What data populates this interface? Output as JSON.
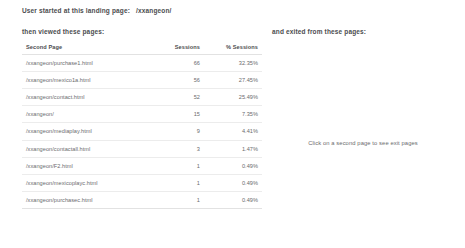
{
  "header": {
    "landing_label": "User started at this landing page:",
    "landing_page": "/xxangeon/",
    "left_caption": "then viewed these pages:",
    "right_caption": "and exited from these pages:"
  },
  "table": {
    "columns": {
      "page": "Second Page",
      "sessions": "Sessions",
      "pct_sessions": "% Sessions"
    },
    "rows": [
      {
        "page": "/xxangeon/purchase1.html",
        "sessions": "66",
        "pct": "32.35%"
      },
      {
        "page": "/xxangeon/mexico1a.html",
        "sessions": "56",
        "pct": "27.45%"
      },
      {
        "page": "/xxangeon/contact.html",
        "sessions": "52",
        "pct": "25.49%"
      },
      {
        "page": "/xxangeon/",
        "sessions": "15",
        "pct": "7.35%"
      },
      {
        "page": "/xxangeon/mediaplay.html",
        "sessions": "9",
        "pct": "4.41%"
      },
      {
        "page": "/xxangeon/contactall.html",
        "sessions": "3",
        "pct": "1.47%"
      },
      {
        "page": "/xxangeon/F2.html",
        "sessions": "1",
        "pct": "0.49%"
      },
      {
        "page": "/xxangeon/mexicoplayc.html",
        "sessions": "1",
        "pct": "0.49%"
      },
      {
        "page": "/xxangeon/purchasec.html",
        "sessions": "1",
        "pct": "0.49%"
      }
    ]
  },
  "exit_panel": {
    "hint": "Click on a second page to see exit pages"
  }
}
